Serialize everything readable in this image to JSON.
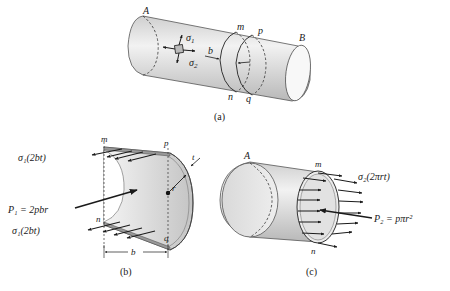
{
  "figure": {
    "panel_a": {
      "caption": "(a)",
      "labels": {
        "end_left": "A",
        "end_right": "B",
        "sigma1": "σ",
        "sigma1_sub": "1",
        "sigma2": "σ",
        "sigma2_sub": "2",
        "width": "b",
        "m": "m",
        "n": "n",
        "p": "p",
        "q": "q"
      }
    },
    "panel_b": {
      "caption": "(b)",
      "labels": {
        "m": "m",
        "n": "n",
        "p": "p",
        "q": "q",
        "t": "t",
        "r": "r",
        "b": "b",
        "top_force": "σ₁(2bt)",
        "bottom_force": "σ₁(2bt)",
        "pressure_force": "P₁ = 2pbr"
      }
    },
    "panel_c": {
      "caption": "(c)",
      "labels": {
        "end": "A",
        "m": "m",
        "n": "n",
        "force": "σ₂(2πrt)",
        "pressure_force": "P₂ = pπr²"
      }
    }
  }
}
